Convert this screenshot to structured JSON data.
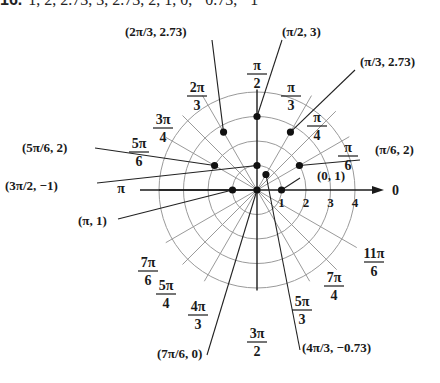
{
  "header": {
    "number": "16.",
    "values_text": "1, 2, 2.73, 3, 2.73, 2, 1, 0, −0.73, −1"
  },
  "chart_data": {
    "type": "scatter",
    "coordinate_system": "polar",
    "title": "",
    "radial_ticks": [
      "1",
      "2",
      "3",
      "4"
    ],
    "radial_max": 4,
    "polar_axis_label": "0",
    "angle_labels": [
      {
        "num": "π",
        "den": "6",
        "angle_deg": 30
      },
      {
        "num": "π",
        "den": "4",
        "angle_deg": 45
      },
      {
        "num": "π",
        "den": "3",
        "angle_deg": 60
      },
      {
        "num": "π",
        "den": "2",
        "angle_deg": 90
      },
      {
        "num": "2π",
        "den": "3",
        "angle_deg": 120
      },
      {
        "num": "3π",
        "den": "4",
        "angle_deg": 135
      },
      {
        "num": "5π",
        "den": "6",
        "angle_deg": 150
      },
      {
        "num": "π",
        "den": "",
        "angle_deg": 180
      },
      {
        "num": "7π",
        "den": "6",
        "angle_deg": 210
      },
      {
        "num": "5π",
        "den": "4",
        "angle_deg": 225
      },
      {
        "num": "4π",
        "den": "3",
        "angle_deg": 240
      },
      {
        "num": "3π",
        "den": "2",
        "angle_deg": 270
      },
      {
        "num": "5π",
        "den": "3",
        "angle_deg": 300
      },
      {
        "num": "7π",
        "den": "4",
        "angle_deg": 315
      },
      {
        "num": "11π",
        "den": "6",
        "angle_deg": 330
      }
    ],
    "points": [
      {
        "theta": "0",
        "r": 1,
        "label": "(0, 1)"
      },
      {
        "theta": "π/6",
        "r": 2,
        "label": "(π/6, 2)"
      },
      {
        "theta": "π/3",
        "r": 2.73,
        "label": "(π/3, 2.73)"
      },
      {
        "theta": "π/2",
        "r": 3,
        "label": "(π/2, 3)"
      },
      {
        "theta": "2π/3",
        "r": 2.73,
        "label": "(2π/3, 2.73)"
      },
      {
        "theta": "5π/6",
        "r": 2,
        "label": "(5π/6, 2)"
      },
      {
        "theta": "π",
        "r": 1,
        "label": "(π, 1)"
      },
      {
        "theta": "7π/6",
        "r": 0,
        "label": "(7π/6, 0)"
      },
      {
        "theta": "4π/3",
        "r": -0.73,
        "label": "(4π/3, −0.73)"
      },
      {
        "theta": "3π/2",
        "r": -1,
        "label": "(3π/2, −1)"
      }
    ],
    "colors": {
      "grid": "#9a9a9a",
      "axis": "#1a1a1a",
      "point": "#111111"
    }
  }
}
